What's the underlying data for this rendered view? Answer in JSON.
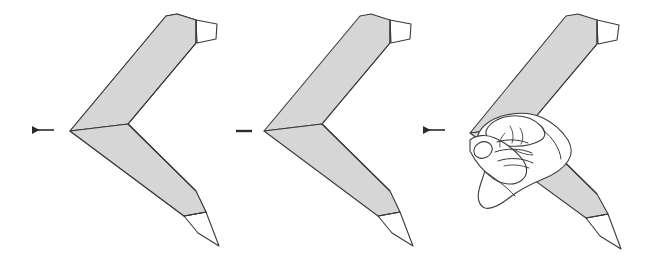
{
  "document": {
    "title": "Origami folding sequence diagram",
    "type": "instructional-illustration",
    "background_color": "#ffffff",
    "width": 652,
    "height": 268
  },
  "style": {
    "paper_fill": "#d6d6d6",
    "paper_fill_light": "#e4e4e4",
    "paper_stroke": "#3a3a3a",
    "flap_fill": "#ffffff",
    "hand_fill": "#ffffff",
    "hand_stroke": "#3c3c3c",
    "arrow_color": "#2b2b2b",
    "stroke_width": 1.1
  },
  "panels": [
    {
      "id": "panel-1",
      "name": "finished-model-left",
      "label": "",
      "description": "Completed V-shaped origami boomerang model, plain view",
      "has_hand": false
    },
    {
      "id": "panel-2",
      "name": "finished-model-middle",
      "label": "",
      "description": "Completed V-shaped origami boomerang model, plain view",
      "has_hand": false
    },
    {
      "id": "panel-3",
      "name": "model-held-in-hand",
      "label": "",
      "description": "V-shaped origami boomerang model gripped between thumb and fingers of a right hand",
      "has_hand": true
    }
  ],
  "arrows": [
    {
      "id": "arrow-1",
      "name": "step-arrow-left",
      "direction": "left",
      "style": "solid-filled-head",
      "x": 30,
      "y": 130,
      "length": 24
    },
    {
      "id": "arrow-2",
      "name": "step-arrow-middle",
      "direction": "left",
      "style": "shaft-only-dash",
      "x": 236,
      "y": 131,
      "length": 16
    },
    {
      "id": "arrow-3",
      "name": "step-arrow-right",
      "direction": "left",
      "style": "solid-filled-head",
      "x": 421,
      "y": 130,
      "length": 24
    }
  ],
  "hand": {
    "name": "right-hand-grip",
    "parts": [
      "thumb",
      "index-finger",
      "middle-finger",
      "ring-finger",
      "little-finger",
      "thumbnail",
      "knuckle-creases"
    ]
  }
}
